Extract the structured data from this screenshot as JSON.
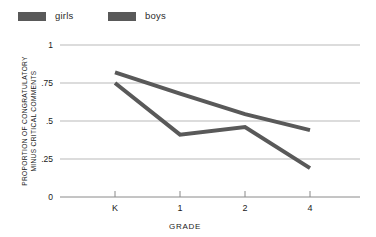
{
  "legend": {
    "items": [
      {
        "label": "girls",
        "color": "#595959",
        "icon": "legend-swatch-icon"
      },
      {
        "label": "boys",
        "color": "#595959",
        "icon": "legend-swatch-icon"
      }
    ]
  },
  "axes": {
    "y": {
      "title_line1": "PROPORTION OF CONGRATULATORY",
      "title_line2": "MINUS CRITICAL COMMENTS",
      "ticks": [
        "0",
        ".25",
        ".5",
        ".75",
        "1"
      ],
      "min": 0,
      "max": 1
    },
    "x": {
      "title": "GRADE",
      "ticks": [
        "K",
        "1",
        "2",
        "4"
      ]
    }
  },
  "chart_data": {
    "type": "line",
    "title": "",
    "xlabel": "GRADE",
    "ylabel": "PROPORTION OF CONGRATULATORY MINUS CRITICAL COMMENTS",
    "categories": [
      "K",
      "1",
      "2",
      "4"
    ],
    "ylim": [
      0,
      1
    ],
    "yticks": [
      0,
      0.25,
      0.5,
      0.75,
      1
    ],
    "ytick_labels": [
      "0",
      ".25",
      ".5",
      ".75",
      "1"
    ],
    "grid": true,
    "legend_position": "top-left",
    "series": [
      {
        "name": "girls",
        "color": "#595959",
        "values": [
          0.75,
          0.41,
          0.46,
          0.19
        ]
      },
      {
        "name": "boys",
        "color": "#595959",
        "values": [
          0.82,
          0.68,
          0.545,
          0.44
        ]
      }
    ]
  },
  "style": {
    "grid_color": "#b9b9b9",
    "axis_color": "#8a8a8a",
    "line_width": 4
  }
}
